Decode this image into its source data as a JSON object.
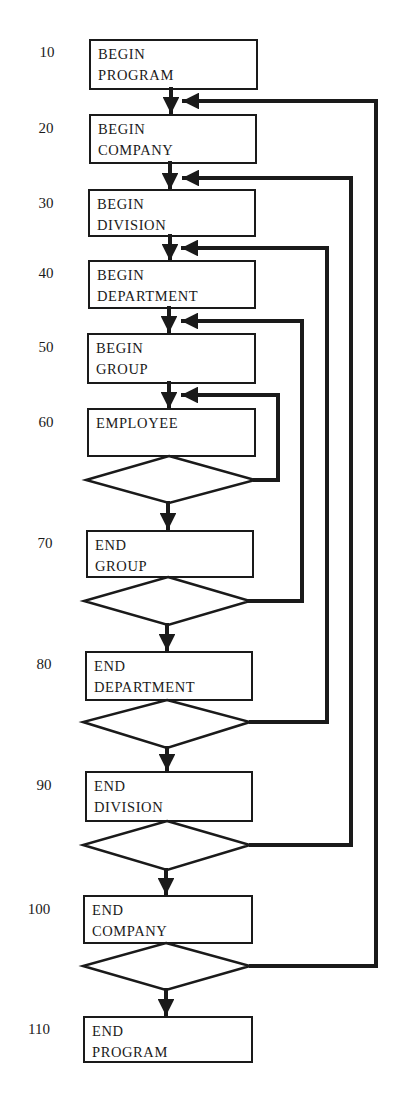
{
  "diagram": {
    "type": "flowchart",
    "steps": [
      {
        "line": "10",
        "text1": "BEGIN",
        "text2": "PROGRAM"
      },
      {
        "line": "20",
        "text1": "BEGIN",
        "text2": "COMPANY"
      },
      {
        "line": "30",
        "text1": "BEGIN",
        "text2": "DIVISION"
      },
      {
        "line": "40",
        "text1": "BEGIN",
        "text2": "DEPARTMENT"
      },
      {
        "line": "50",
        "text1": "BEGIN",
        "text2": "GROUP"
      },
      {
        "line": "60",
        "text1": "EMPLOYEE",
        "text2": ""
      },
      {
        "line": "70",
        "text1": "END",
        "text2": "GROUP"
      },
      {
        "line": "80",
        "text1": "END",
        "text2": "DEPARTMENT"
      },
      {
        "line": "90",
        "text1": "END",
        "text2": "DIVISION"
      },
      {
        "line": "100",
        "text1": "END",
        "text2": "COMPANY"
      },
      {
        "line": "110",
        "text1": "END",
        "text2": "PROGRAM"
      }
    ],
    "decisions": [
      {
        "after_line": "60",
        "loops_back_to": "60"
      },
      {
        "after_line": "70",
        "loops_back_to": "50"
      },
      {
        "after_line": "80",
        "loops_back_to": "40"
      },
      {
        "after_line": "90",
        "loops_back_to": "30"
      },
      {
        "after_line": "100",
        "loops_back_to": "20"
      }
    ],
    "colors": {
      "ink": "#1a1a1a",
      "background": "#ffffff"
    }
  }
}
